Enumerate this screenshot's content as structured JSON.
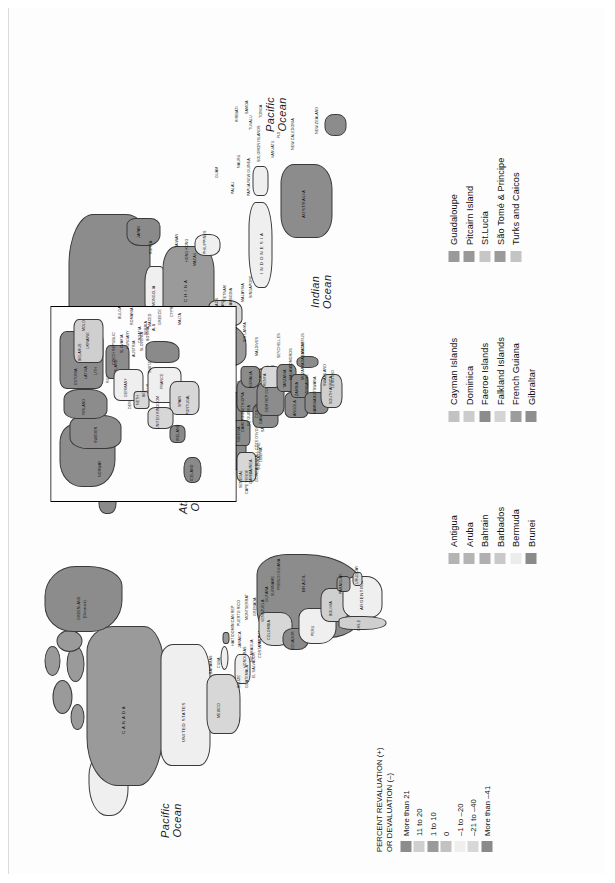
{
  "figure": {
    "title_hidden": "",
    "oceans": [
      {
        "name": "pacific-ocean-east",
        "line1": "Pacific",
        "line2": "Ocean"
      },
      {
        "name": "pacific-ocean-west",
        "line1": "Pacific",
        "line2": "Ocean"
      },
      {
        "name": "atlantic-ocean",
        "line1": "Atlantic",
        "line2": "Ocean"
      },
      {
        "name": "indian-ocean",
        "line1": "Indian",
        "line2": "Ocean"
      }
    ]
  },
  "value_legend": {
    "title_line1": "PERCENT REVALUATION (+)",
    "title_line2": "OR DEVALUATION (–)",
    "items": [
      {
        "label": "More than 21",
        "color": "#8c8c8c"
      },
      {
        "label": "11 to 20",
        "color": "#cfcfcf"
      },
      {
        "label": "1 to 10",
        "color": "#9a9a9a"
      },
      {
        "label": "0",
        "color": "#c2c2c2"
      },
      {
        "label": "–1 to –20",
        "color": "#efefef"
      },
      {
        "label": "–21 to –40",
        "color": "#d7d7d7"
      },
      {
        "label": "More than –41",
        "color": "#8a8a8a"
      }
    ]
  },
  "territory_legends": [
    {
      "name": "territory-legend-column-1",
      "items": [
        {
          "label": "Antigua",
          "color": "#b4b4b4"
        },
        {
          "label": "Aruba",
          "color": "#b4b4b4"
        },
        {
          "label": "Bahrain",
          "color": "#b0b0b0"
        },
        {
          "label": "Barbados",
          "color": "#c9c9c9"
        },
        {
          "label": "Bermuda",
          "color": "#ececec"
        },
        {
          "label": "Brunei",
          "color": "#8a8a8a"
        }
      ]
    },
    {
      "name": "territory-legend-column-2",
      "items": [
        {
          "label": "Cayman Islands",
          "color": "#c2c2c2"
        },
        {
          "label": "Dominica",
          "color": "#cccccc"
        },
        {
          "label": "Faeroe Islands",
          "color": "#8c8c8c"
        },
        {
          "label": "Falkland Islands",
          "color": "#d4d4d4"
        },
        {
          "label": "French Guiana",
          "color": "#9c9c9c"
        },
        {
          "label": "Gibraltar",
          "color": "#8e8e8e"
        }
      ]
    },
    {
      "name": "territory-legend-column-3",
      "items": [
        {
          "label": "Guadaloupe",
          "color": "#9a9a9a"
        },
        {
          "label": "Pitcairn Island",
          "color": "#989898"
        },
        {
          "label": "St.Lucia",
          "color": "#c6c6c6"
        },
        {
          "label": "São Tomé & Principe",
          "color": "#9a9a9a"
        },
        {
          "label": "Turks and Caicos",
          "color": "#c4c4c4"
        }
      ]
    }
  ],
  "map_labels": {
    "main": [
      "R U S S I A",
      "C A N A D A",
      "UNITED STATES",
      "GREENLAND",
      "(Denmark)",
      "MEXICO",
      "BRAZIL",
      "ARGENTINA",
      "CHILE",
      "PERU",
      "BOLIVIA",
      "PARAGUAY",
      "URUGUAY",
      "COLOMBIA",
      "VENEZUELA",
      "ECUADOR",
      "GUYANA",
      "SURINAME",
      "FRENCH GUIANA",
      "PANAMA",
      "COSTA RICA",
      "NICARAGUA",
      "HONDURAS",
      "EL SALVADOR",
      "GUATEMALA",
      "BELIZE",
      "CUBA",
      "HAITI",
      "JAMAICA",
      "DOMINICAN REP",
      "PUERTO RICO",
      "BAHAMAS",
      "MONTSERRAT",
      "GRENADA",
      "TRINIDAD AND TOBAGO",
      "I N D O N E S I A",
      "AUSTRALIA",
      "NEW ZEALAND",
      "PAPUA NEW GUINEA",
      "C H I N A",
      "MONGOLIA",
      "INDIA",
      "PAKISTAN",
      "AFGHANISTAN",
      "IRAN",
      "IRAQ",
      "SAUDI ARABIA",
      "YEMEN",
      "OMAN",
      "UAE",
      "TURKEY",
      "EGYPT",
      "LIBYA",
      "ALGERIA",
      "MALI",
      "NIGER",
      "CHAD",
      "SUDAN",
      "ETHIOPIA",
      "SOMALIA",
      "KENYA",
      "TANZANIA",
      "ANGOLA",
      "NAMIBIA",
      "BOTSWANA",
      "SOUTH AFRICA",
      "MADAGASCAR",
      "NIGERIA",
      "CAMEROON",
      "GABON",
      "CONGO",
      "DEM REP CONGO",
      "ZAMBIA",
      "ZIMBABWE",
      "MOZAMBIQUE",
      "MALAWI",
      "WESTERN SAHARA",
      "MAURITANIA",
      "SENEGAL",
      "GUINEA",
      "SIERRA LEONE",
      "LIBERIA",
      "CÔTE D'IVOIRE",
      "GHANA",
      "TOGO",
      "BENIN",
      "BURKINA FASO",
      "CAPE VERDE",
      "GAMBIA",
      "GUINEA-BISSAU",
      "JAPAN",
      "KOREA",
      "TAIWAN",
      "PHILIPPINES",
      "VIETNAM",
      "THAILAND",
      "MYANMAR",
      "MALAYSIA",
      "SINGAPORE",
      "SRI LANKA",
      "NEPAL",
      "BHUTAN",
      "BANGLADESH",
      "KAZAKHSTAN",
      "UZBEKISTAN",
      "TURKMENISTAN",
      "TAJIKISTAN",
      "KYRGYZSTAN",
      "AZERBAIJAN",
      "GEORGIA",
      "ARMENIA",
      "SYRIA",
      "JORDAN",
      "ISRAEL",
      "LEBANON",
      "KUWAIT",
      "QATAR",
      "ERITREA",
      "DJIBOUTI",
      "UGANDA",
      "RWANDA",
      "BURUNDI",
      "LESOTHO",
      "SWAZILAND",
      "MAURITIUS",
      "SEYCHELLES",
      "MALDIVES",
      "COMOROS",
      "SOLOMON ISLANDS",
      "VANUATU",
      "FIJI",
      "NEW CALEDONIA",
      "GUAM",
      "KIRIBATI",
      "TUVALU",
      "TONGA",
      "SAMOA",
      "NAURU",
      "PALAU",
      "CAMBODIA",
      "LAOS",
      "HONG KONG",
      "MACAU",
      "EQ GUINEA",
      "CEN AFR REP",
      "SÃO TOMÉ"
    ],
    "inset": [
      "NORWAY",
      "SWEDEN",
      "FINLAND",
      "ESTONIA",
      "LATVIA",
      "LITH",
      "BELARUS",
      "UKRAINE",
      "MOLD",
      "POLAND",
      "GERMANY",
      "NETH",
      "BEL",
      "LUX",
      "FRANCE",
      "SPAIN",
      "PORTUGAL",
      "IRELAND",
      "UNITED KINGDOM",
      "ICELAND",
      "DEN",
      "SWITZ",
      "ITALY",
      "AUSTRIA",
      "CZECH REPUBLIC",
      "SLOVAKIA",
      "HUNGARY",
      "SLOVENIA",
      "CROATIA",
      "BOSNIA",
      "SERBIA",
      "ALB",
      "MACED",
      "GREECE",
      "BULGARIA",
      "ROMANIA",
      "RUS",
      "MALTA",
      "CYPRUS"
    ]
  }
}
